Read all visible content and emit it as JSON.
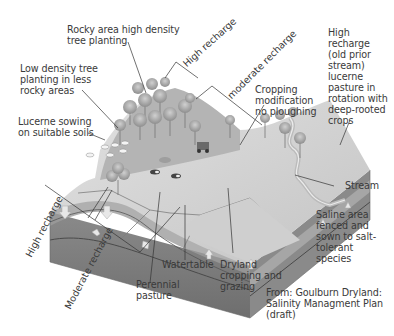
{
  "diagram": {
    "labels": {
      "rocky_area": "Rocky area high density\ntree planting",
      "low_density": "Low density tree\nplanting in less\nrocky areas",
      "lucerne_sowing": "Lucerne sowing\non suitable soils",
      "high_recharge_top": "High recharge",
      "moderate_recharge_top": "moderate recharge",
      "cropping_mod": "Cropping\nmodification\nno ploughing",
      "high_recharge_stream": "High\nrecharge\n(old prior\nstream)\nlucerne\npasture in\nrotation with\ndeep-rooted\ncrops",
      "stream": "Stream",
      "saline_area": "Saline area\nfenced and\nsown to salt-\ntolerant\nspecies",
      "high_recharge_bottom": "High recharge",
      "moderate_recharge_bottom": "Moderate recharge",
      "watertable": "Watertable",
      "perennial_pasture": "Perennial\npasture",
      "dryland_cropping": "Dryland\ncropping and\ngrazing",
      "source": "From: Goulburn Dryland:\nSalinity Managment Plan\n(draft)"
    },
    "colors": {
      "surface_light": "#d6d6d6",
      "surface_mid": "#bdbdbd",
      "soil_dark": "#7a7a7a",
      "soil_mid": "#9a9a9a",
      "aquifer": "#8c8c8c",
      "tree": "#a8a8a8",
      "line": "#333333"
    }
  }
}
